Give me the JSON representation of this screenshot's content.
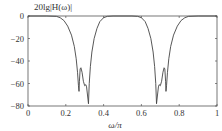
{
  "chart_data": {
    "type": "line",
    "title": "",
    "ylabel": "20lg|H(ω)|",
    "xlabel": "ω/π",
    "xlim": [
      0,
      1
    ],
    "ylim": [
      -80,
      0
    ],
    "grid": false,
    "legend": null,
    "x_ticks": [
      0,
      0.2,
      0.4,
      0.6,
      0.8,
      1
    ],
    "x_tick_labels": [
      "0",
      "0.2",
      "0.4",
      "0.6",
      "0.8",
      "1"
    ],
    "y_ticks": [
      0,
      -20,
      -40,
      -60,
      -80
    ],
    "y_tick_labels": [
      "0",
      "−20",
      "−40",
      "−60",
      "−80"
    ],
    "series": [
      {
        "name": "magnitude response",
        "color": "#444444",
        "points": [
          [
            0.0,
            0
          ],
          [
            0.1,
            0
          ],
          [
            0.15,
            -0.3
          ],
          [
            0.17,
            -1.5
          ],
          [
            0.19,
            -4
          ],
          [
            0.21,
            -9
          ],
          [
            0.23,
            -17
          ],
          [
            0.245,
            -27
          ],
          [
            0.255,
            -38
          ],
          [
            0.262,
            -50
          ],
          [
            0.267,
            -62
          ],
          [
            0.27,
            -67
          ],
          [
            0.272,
            -58
          ],
          [
            0.276,
            -47
          ],
          [
            0.28,
            -46
          ],
          [
            0.286,
            -50
          ],
          [
            0.293,
            -58
          ],
          [
            0.3,
            -62
          ],
          [
            0.306,
            -61
          ],
          [
            0.31,
            -63
          ],
          [
            0.316,
            -72
          ],
          [
            0.32,
            -78
          ],
          [
            0.324,
            -60
          ],
          [
            0.33,
            -45
          ],
          [
            0.338,
            -32
          ],
          [
            0.35,
            -20
          ],
          [
            0.365,
            -11
          ],
          [
            0.38,
            -5
          ],
          [
            0.4,
            -1.5
          ],
          [
            0.42,
            -0.3
          ],
          [
            0.45,
            0
          ],
          [
            0.55,
            0
          ],
          [
            0.58,
            -0.3
          ],
          [
            0.6,
            -1.5
          ],
          [
            0.62,
            -5
          ],
          [
            0.635,
            -11
          ],
          [
            0.65,
            -20
          ],
          [
            0.662,
            -32
          ],
          [
            0.67,
            -45
          ],
          [
            0.676,
            -60
          ],
          [
            0.68,
            -78
          ],
          [
            0.684,
            -72
          ],
          [
            0.69,
            -63
          ],
          [
            0.694,
            -61
          ],
          [
            0.7,
            -62
          ],
          [
            0.707,
            -58
          ],
          [
            0.714,
            -50
          ],
          [
            0.72,
            -46
          ],
          [
            0.724,
            -47
          ],
          [
            0.728,
            -58
          ],
          [
            0.73,
            -67
          ],
          [
            0.733,
            -62
          ],
          [
            0.738,
            -50
          ],
          [
            0.745,
            -38
          ],
          [
            0.755,
            -27
          ],
          [
            0.77,
            -17
          ],
          [
            0.79,
            -9
          ],
          [
            0.81,
            -4
          ],
          [
            0.83,
            -1.5
          ],
          [
            0.85,
            -0.3
          ],
          [
            0.9,
            0
          ],
          [
            1.0,
            0
          ]
        ]
      }
    ]
  },
  "plot_area": {
    "left": 28,
    "right": 217,
    "top": 16,
    "bottom": 106
  }
}
